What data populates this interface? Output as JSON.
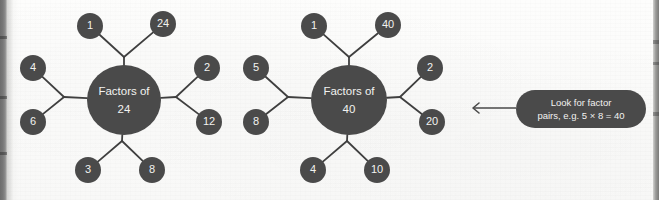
{
  "page": {
    "background_color": "#fbfbfa",
    "node_color": "#4a4a4a",
    "node_text_color": "#f2f2f0",
    "connector_color": "#3f3f3f",
    "callout_color": "#4a4a4a",
    "spine_color": "#777777"
  },
  "diagrams": [
    {
      "id": "factors-of-24",
      "hub": {
        "line1": "Factors of",
        "line2": "24",
        "cx": 124,
        "cy": 100,
        "rx": 37,
        "ry": 35
      },
      "branches": [
        {
          "name": "top",
          "junction": {
            "x": 124,
            "y": 57
          },
          "nodes": [
            {
              "label": "1",
              "cx": 90,
              "cy": 26,
              "r": 13
            },
            {
              "label": "24",
              "cx": 163,
              "cy": 24,
              "r": 13
            }
          ]
        },
        {
          "name": "left",
          "junction": {
            "x": 64,
            "y": 97
          },
          "nodes": [
            {
              "label": "4",
              "cx": 33,
              "cy": 68,
              "r": 13
            },
            {
              "label": "6",
              "cx": 33,
              "cy": 122,
              "r": 13
            }
          ]
        },
        {
          "name": "right",
          "junction": {
            "x": 176,
            "y": 97
          },
          "nodes": [
            {
              "label": "2",
              "cx": 207,
              "cy": 68,
              "r": 13
            },
            {
              "label": "12",
              "cx": 209,
              "cy": 122,
              "r": 13
            }
          ]
        },
        {
          "name": "bottom",
          "junction": {
            "x": 122,
            "y": 141
          },
          "nodes": [
            {
              "label": "3",
              "cx": 88,
              "cy": 170,
              "r": 13
            },
            {
              "label": "8",
              "cx": 152,
              "cy": 170,
              "r": 13
            }
          ]
        }
      ]
    },
    {
      "id": "factors-of-40",
      "hub": {
        "line1": "Factors of",
        "line2": "40",
        "cx": 349,
        "cy": 100,
        "rx": 38,
        "ry": 35
      },
      "branches": [
        {
          "name": "top",
          "junction": {
            "x": 349,
            "y": 57
          },
          "nodes": [
            {
              "label": "1",
              "cx": 314,
              "cy": 26,
              "r": 13
            },
            {
              "label": "40",
              "cx": 388,
              "cy": 25,
              "r": 13
            }
          ]
        },
        {
          "name": "left",
          "junction": {
            "x": 288,
            "y": 97
          },
          "nodes": [
            {
              "label": "5",
              "cx": 256,
              "cy": 68,
              "r": 13
            },
            {
              "label": "8",
              "cx": 256,
              "cy": 122,
              "r": 13
            }
          ]
        },
        {
          "name": "right",
          "junction": {
            "x": 400,
            "y": 97
          },
          "nodes": [
            {
              "label": "2",
              "cx": 430,
              "cy": 68,
              "r": 13
            },
            {
              "label": "20",
              "cx": 432,
              "cy": 122,
              "r": 13
            }
          ]
        },
        {
          "name": "bottom",
          "junction": {
            "x": 347,
            "y": 141
          },
          "nodes": [
            {
              "label": "4",
              "cx": 313,
              "cy": 170,
              "r": 13
            },
            {
              "label": "10",
              "cx": 377,
              "cy": 170,
              "r": 13
            }
          ]
        }
      ]
    }
  ],
  "callout": {
    "line1": "Look for factor",
    "line2": "pairs, e.g. 5 × 8 = 40",
    "box": {
      "x": 516,
      "y": 90,
      "width": 130,
      "height": 38,
      "radius": 19
    },
    "arrow": {
      "x1": 516,
      "y1": 108,
      "x2": 473,
      "y2": 108
    }
  }
}
